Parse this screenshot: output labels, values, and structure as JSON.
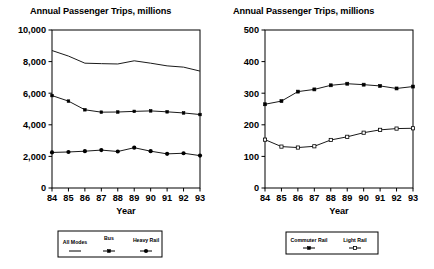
{
  "chart_data": [
    {
      "type": "line",
      "panel": "left",
      "title": "Annual Passenger Trips, millions",
      "xlabel": "Year",
      "ylabel": "",
      "categories": [
        "84",
        "85",
        "86",
        "87",
        "88",
        "89",
        "90",
        "91",
        "92",
        "93"
      ],
      "xlim": [
        0,
        9
      ],
      "ylim": [
        0,
        10000
      ],
      "yticks": [
        "0",
        "2,000",
        "4,000",
        "6,000",
        "8,000",
        "10,000"
      ],
      "ytick_values": [
        0,
        2000,
        4000,
        6000,
        8000,
        10000
      ],
      "grid": false,
      "legend_position": "below",
      "series": [
        {
          "name": "All Modes",
          "marker": "none",
          "values": [
            8700,
            8350,
            7900,
            7870,
            7850,
            8050,
            7900,
            7730,
            7650,
            7400
          ]
        },
        {
          "name": "Bus",
          "marker": "small-square",
          "values": [
            5850,
            5500,
            4950,
            4800,
            4810,
            4850,
            4880,
            4820,
            4750,
            4650
          ]
        },
        {
          "name": "Heavy Rail",
          "marker": "filled-circle",
          "values": [
            2250,
            2280,
            2330,
            2400,
            2310,
            2550,
            2330,
            2160,
            2200,
            2050
          ]
        }
      ]
    },
    {
      "type": "line",
      "panel": "right",
      "title": "Annual Passenger Trips, millions",
      "xlabel": "Year",
      "ylabel": "",
      "categories": [
        "84",
        "85",
        "86",
        "87",
        "88",
        "89",
        "90",
        "91",
        "92",
        "93"
      ],
      "xlim": [
        0,
        9
      ],
      "ylim": [
        0,
        500
      ],
      "yticks": [
        "0",
        "100",
        "200",
        "300",
        "400",
        "500"
      ],
      "ytick_values": [
        0,
        100,
        200,
        300,
        400,
        500
      ],
      "grid": false,
      "legend_position": "below",
      "series": [
        {
          "name": "Commuter Rail",
          "marker": "filled-square",
          "values": [
            265,
            275,
            305,
            312,
            325,
            330,
            327,
            323,
            315,
            321
          ]
        },
        {
          "name": "Light Rail",
          "marker": "open-square",
          "values": [
            153,
            131,
            128,
            132,
            152,
            162,
            175,
            184,
            188,
            189
          ]
        }
      ]
    }
  ],
  "left_chart": {
    "title": "Annual Passenger Trips, millions",
    "xlabel": "Year",
    "ytick_labels": [
      "10,000",
      "8,000",
      "6,000",
      "4,000",
      "2,000",
      "0"
    ],
    "xtick_labels": [
      "84",
      "85",
      "86",
      "87",
      "88",
      "89",
      "90",
      "91",
      "92",
      "93"
    ],
    "legend": [
      {
        "label": "All Modes"
      },
      {
        "label": "Bus"
      },
      {
        "label": "Heavy Rail"
      }
    ]
  },
  "right_chart": {
    "title": "Annual Passenger Trips, millions",
    "xlabel": "Year",
    "ytick_labels": [
      "500",
      "400",
      "300",
      "200",
      "100",
      "0"
    ],
    "xtick_labels": [
      "84",
      "85",
      "86",
      "87",
      "88",
      "89",
      "90",
      "91",
      "92",
      "93"
    ],
    "legend": [
      {
        "label": "Commuter Rail"
      },
      {
        "label": "Light Rail"
      }
    ]
  },
  "colors": {
    "ink": "#000000",
    "background": "#ffffff"
  }
}
